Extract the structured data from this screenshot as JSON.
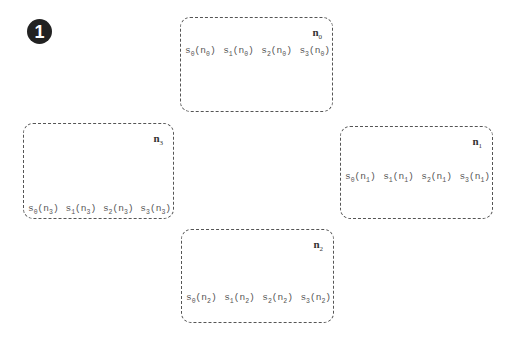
{
  "step_badge": {
    "label": "1"
  },
  "nodes": [
    {
      "id": "n0",
      "label_base": "n",
      "label_sub": "0",
      "box": {
        "left": 180,
        "top": 17,
        "width": 153,
        "height": 95
      },
      "slots_top": 27,
      "slots": [
        {
          "fn": "s",
          "fn_sub": "0",
          "arg": "n",
          "arg_sub": "0"
        },
        {
          "fn": "s",
          "fn_sub": "1",
          "arg": "n",
          "arg_sub": "0"
        },
        {
          "fn": "s",
          "fn_sub": "2",
          "arg": "n",
          "arg_sub": "0"
        },
        {
          "fn": "s",
          "fn_sub": "3",
          "arg": "n",
          "arg_sub": "0"
        }
      ]
    },
    {
      "id": "n1",
      "label_base": "n",
      "label_sub": "1",
      "box": {
        "left": 340,
        "top": 126,
        "width": 153,
        "height": 93
      },
      "slots_top": 44,
      "slots": [
        {
          "fn": "s",
          "fn_sub": "0",
          "arg": "n",
          "arg_sub": "1"
        },
        {
          "fn": "s",
          "fn_sub": "1",
          "arg": "n",
          "arg_sub": "1"
        },
        {
          "fn": "s",
          "fn_sub": "2",
          "arg": "n",
          "arg_sub": "1"
        },
        {
          "fn": "s",
          "fn_sub": "3",
          "arg": "n",
          "arg_sub": "1"
        }
      ]
    },
    {
      "id": "n2",
      "label_base": "n",
      "label_sub": "2",
      "box": {
        "left": 181,
        "top": 229,
        "width": 153,
        "height": 94
      },
      "slots_top": 62,
      "slots": [
        {
          "fn": "s",
          "fn_sub": "0",
          "arg": "n",
          "arg_sub": "2"
        },
        {
          "fn": "s",
          "fn_sub": "1",
          "arg": "n",
          "arg_sub": "2"
        },
        {
          "fn": "s",
          "fn_sub": "2",
          "arg": "n",
          "arg_sub": "2"
        },
        {
          "fn": "s",
          "fn_sub": "3",
          "arg": "n",
          "arg_sub": "2"
        }
      ]
    },
    {
      "id": "n3",
      "label_base": "n",
      "label_sub": "3",
      "box": {
        "left": 23,
        "top": 123,
        "width": 151,
        "height": 96
      },
      "slots_top": 79,
      "slots": [
        {
          "fn": "s",
          "fn_sub": "0",
          "arg": "n",
          "arg_sub": "3"
        },
        {
          "fn": "s",
          "fn_sub": "1",
          "arg": "n",
          "arg_sub": "3"
        },
        {
          "fn": "s",
          "fn_sub": "2",
          "arg": "n",
          "arg_sub": "3"
        },
        {
          "fn": "s",
          "fn_sub": "3",
          "arg": "n",
          "arg_sub": "3"
        }
      ]
    }
  ]
}
